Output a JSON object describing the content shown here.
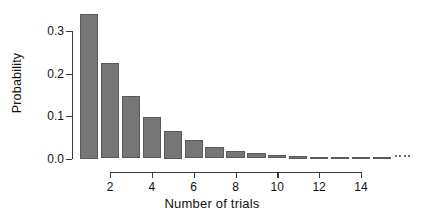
{
  "chart_data": {
    "type": "bar",
    "title": "",
    "subtitle": "",
    "xlabel": "Number of trials",
    "ylabel": "Probability",
    "categories": [
      1,
      2,
      3,
      4,
      5,
      6,
      7,
      8,
      9,
      10,
      11,
      12,
      13,
      14,
      15
    ],
    "values": [
      0.34,
      0.224,
      0.148,
      0.098,
      0.065,
      0.043,
      0.028,
      0.018,
      0.012,
      0.008,
      0.005,
      0.0035,
      0.0023,
      0.0015,
      0.001
    ],
    "series": [
      {
        "name": "Geometric probability",
        "values": [
          0.34,
          0.224,
          0.148,
          0.098,
          0.065,
          0.043,
          0.028,
          0.018,
          0.012,
          0.008,
          0.005,
          0.0035,
          0.0023,
          0.0015,
          0.001
        ]
      }
    ],
    "xlim": [
      0.4,
      16.2
    ],
    "ylim": [
      0.0,
      0.355
    ],
    "x_ticks": [
      2,
      4,
      6,
      8,
      10,
      12,
      14
    ],
    "x_tick_labels": [
      "2",
      "4",
      "6",
      "8",
      "10",
      "12",
      "14"
    ],
    "y_ticks": [
      0.0,
      0.1,
      0.2,
      0.3
    ],
    "y_tick_labels": [
      "0.0",
      "0.1",
      "0.2",
      "0.3"
    ],
    "grid": false,
    "legend": null,
    "legend_position": "none",
    "annotations": [
      "ellipsis dots continuing the tail at right"
    ],
    "bar_color": "#767676",
    "bar_edge_color": "#5a5a5a",
    "axis_color": "#3a3a3a",
    "background_color": "#ffffff"
  }
}
